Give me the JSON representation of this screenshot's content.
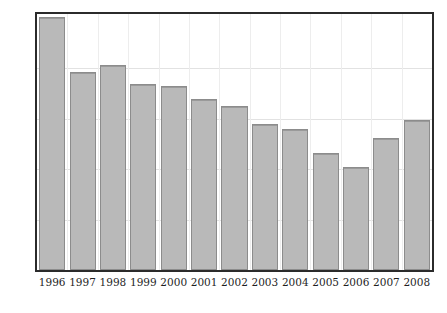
{
  "chart_data": {
    "type": "bar",
    "title": "",
    "subtitle": "",
    "xlabel": "",
    "ylabel": "",
    "categories": [
      "1996",
      "1997",
      "1998",
      "1999",
      "2000",
      "2001",
      "2002",
      "2003",
      "2004",
      "2005",
      "2006",
      "2007",
      "2008"
    ],
    "values": [
      25.1,
      19.6,
      20.3,
      18.5,
      18.3,
      17.0,
      16.3,
      14.5,
      14.0,
      11.6,
      10.2,
      13.1,
      14.9
    ],
    "series": [
      {
        "name": "",
        "values": [
          25.1,
          19.6,
          20.3,
          18.5,
          18.3,
          17.0,
          16.3,
          14.5,
          14.0,
          11.6,
          10.2,
          13.1,
          14.9
        ]
      }
    ],
    "ylim": [
      0,
      25.4
    ],
    "yticks": [
      0,
      5,
      10,
      15,
      20
    ],
    "ytick_labels": [
      "0",
      "5",
      "10",
      "15",
      "20"
    ],
    "xtick_labels": [
      "1996",
      "1997",
      "1998",
      "1999",
      "2000",
      "2001",
      "2002",
      "2003",
      "2004",
      "2005",
      "2006",
      "2007",
      "2008"
    ],
    "grid": true,
    "grid_axis": "both",
    "legend": false,
    "legend_position": "none",
    "bar_fill_color": "#b9b9b9",
    "bar_border_color": "#8c8c8c",
    "grid_color": "#e2e2e2",
    "frame_color": "#2b2b2b",
    "annotations": []
  },
  "caption": {
    "text": ""
  }
}
